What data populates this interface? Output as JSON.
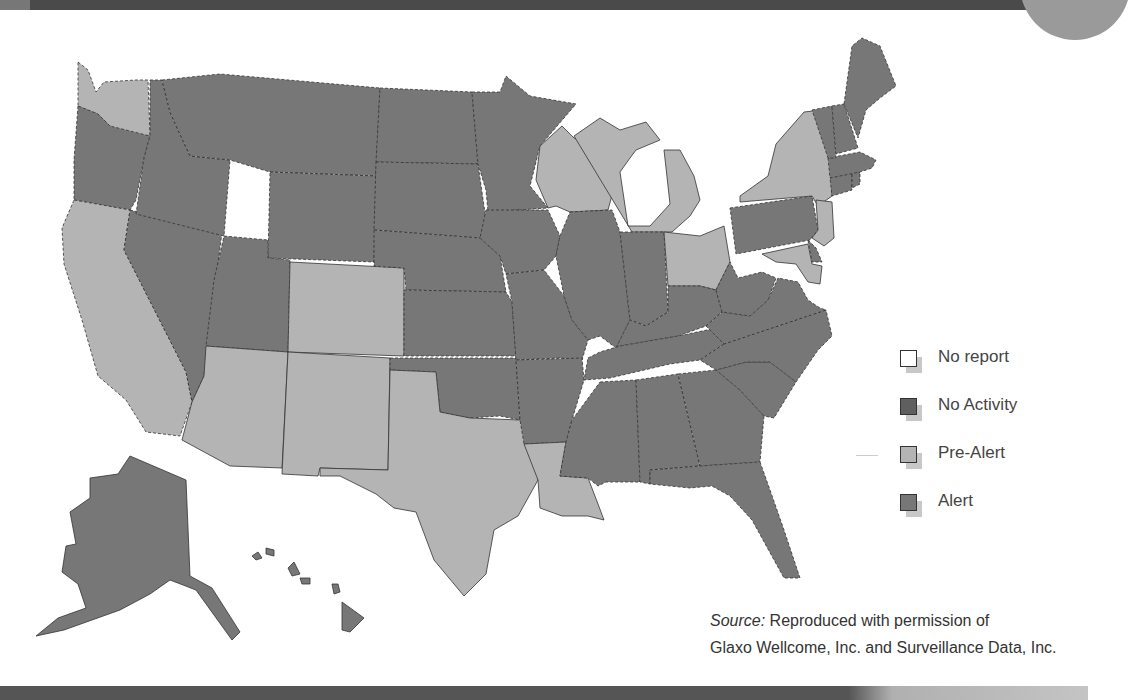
{
  "colors": {
    "no_report": "#ffffff",
    "no_activity": "#666666",
    "pre_alert": "#b4b4b4",
    "alert": "#777777",
    "border": "#333333"
  },
  "legend": {
    "items": [
      {
        "key": "no_report",
        "label": "No report",
        "color": "#ffffff"
      },
      {
        "key": "no_activity",
        "label": "No Activity",
        "color": "#5f5f5f"
      },
      {
        "key": "pre_alert",
        "label": "Pre-Alert",
        "color": "#b4b4b4"
      },
      {
        "key": "alert",
        "label": "Alert",
        "color": "#777777"
      }
    ]
  },
  "source": {
    "prefix": "Source:",
    "line1": " Reproduced with permission of",
    "line2": "Glaxo Wellcome, Inc. and Surveillance Data, Inc."
  },
  "states": {
    "WA": "pre_alert",
    "OR": "alert",
    "CA": "pre_alert",
    "NV": "alert",
    "ID": "alert",
    "MT": "alert",
    "WY": "alert",
    "UT": "alert",
    "CO": "pre_alert",
    "AZ": "pre_alert",
    "NM": "pre_alert",
    "ND": "alert",
    "SD": "alert",
    "NE": "alert",
    "KS": "alert",
    "OK": "alert",
    "TX": "pre_alert",
    "MN": "alert",
    "IA": "alert",
    "MO": "alert",
    "AR": "alert",
    "LA": "pre_alert",
    "WI": "pre_alert",
    "MI": "pre_alert",
    "IL": "alert",
    "IN": "alert",
    "OH": "pre_alert",
    "KY": "alert",
    "TN": "alert",
    "MS": "alert",
    "AL": "alert",
    "GA": "alert",
    "FL": "alert",
    "SC": "alert",
    "NC": "alert",
    "VA": "alert",
    "WV": "alert",
    "PA": "alert",
    "NY": "pre_alert",
    "NJ": "pre_alert",
    "DE": "alert",
    "MD": "pre_alert",
    "CT": "alert",
    "RI": "alert",
    "MA": "alert",
    "VT": "alert",
    "NH": "alert",
    "ME": "alert",
    "AK": "alert",
    "HI": "alert"
  }
}
